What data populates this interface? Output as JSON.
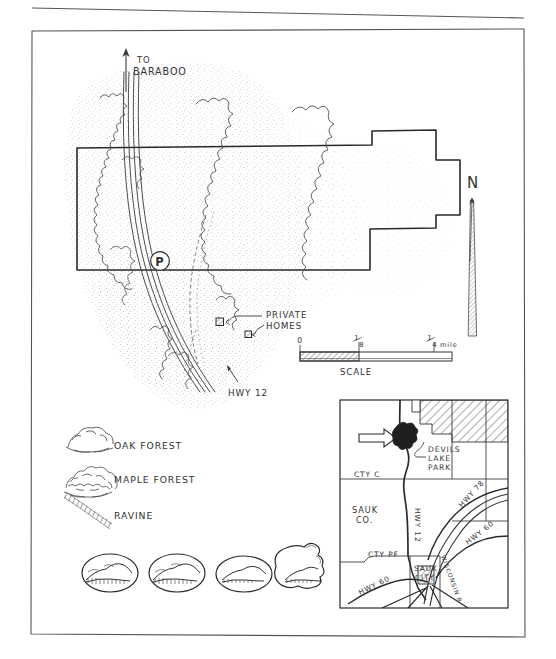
{
  "document": {
    "type": "hand-drawn-map",
    "subject": "Baraboo Hills / Devil's Lake area park property map",
    "background_color": "#ffffff",
    "ink_color": "#333333"
  },
  "main_map": {
    "direction_label": {
      "line1": "TO",
      "line2": "BARABOO"
    },
    "north_arrow_label": "N",
    "parking_symbol": "P",
    "highway_label": "HWY 12",
    "private_homes_label": {
      "line1": "PRIVATE",
      "line2": "HOMES"
    }
  },
  "scale_bar": {
    "title": "SCALE",
    "ticks": [
      "0",
      "1/8",
      "1/4 mile"
    ],
    "tick_zero": "0",
    "tick_eighth_num": "1",
    "tick_eighth_den": "8",
    "tick_quarter_num": "1",
    "tick_quarter_den": "4",
    "tick_quarter_unit": "mile"
  },
  "legend": {
    "items": [
      {
        "symbol": "oak-forest-symbol",
        "label": "OAK FOREST"
      },
      {
        "symbol": "maple-forest-symbol",
        "label": "MAPLE FOREST"
      },
      {
        "symbol": "ravine-symbol",
        "label": "RAVINE"
      }
    ]
  },
  "vignettes": {
    "count": 4,
    "items": [
      {
        "name": "landscape-vignette-1"
      },
      {
        "name": "landscape-vignette-2"
      },
      {
        "name": "landscape-vignette-3"
      },
      {
        "name": "landscape-vignette-4"
      }
    ]
  },
  "inset_map": {
    "labels": {
      "devils_lake_park": {
        "line1": "DEVILS",
        "line2": "LAKE",
        "line3": "PARK"
      },
      "county_c": "CTY C",
      "county_pf": "CTY PF",
      "sauk_county": {
        "line1": "SAUK",
        "line2": "CO."
      },
      "sauk_city": {
        "line1": "SAUK",
        "line2": "CITY"
      },
      "hwy_12": "HWY 12",
      "hwy_78": "HWY 78",
      "hwy_60_east": "HWY 60",
      "hwy_60_west": "HWY 60",
      "wisconsin_river": "WISCONSIN R"
    }
  }
}
